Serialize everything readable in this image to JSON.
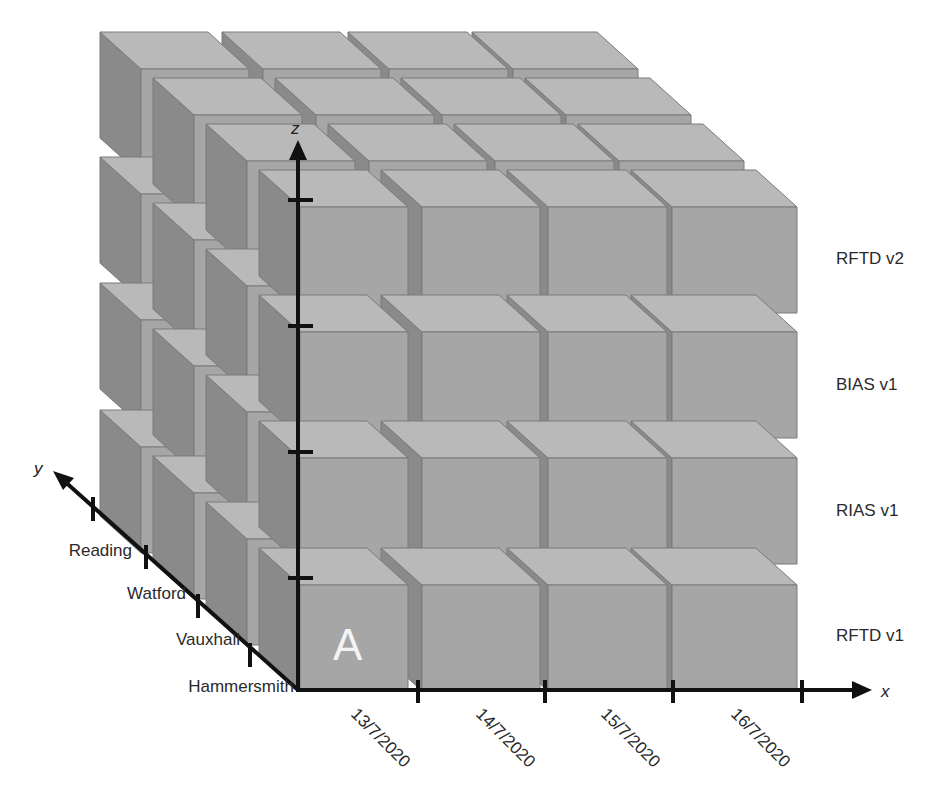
{
  "diagram": {
    "type": "3d-data-cube",
    "colors": {
      "front_face": "#a6a6a6",
      "top_face": "#b9b9b9",
      "side_face": "#8a8a8a",
      "edge": "#7a7a7a",
      "axis": "#111111",
      "text": "#2a2a2a",
      "cell_label": "#f4f4f4"
    },
    "axes": {
      "x": {
        "name": "x",
        "ticks": [
          "13/7/2020",
          "14/7/2020",
          "15/7/2020",
          "16/7/2020"
        ]
      },
      "y": {
        "name": "y",
        "ticks": [
          "Hammersmith",
          "Vauxhall",
          "Watford",
          "Reading"
        ]
      },
      "z": {
        "name": "z",
        "ticks": [
          "RFTD v1",
          "RIAS v1",
          "BIAS v1",
          "RFTD v2"
        ]
      }
    },
    "highlighted_cell": {
      "label": "A",
      "x": "13/7/2020",
      "y": "Hammersmith",
      "z": "RFTD v1"
    },
    "grid": {
      "nx": 4,
      "ny": 4,
      "nz": 4
    }
  }
}
